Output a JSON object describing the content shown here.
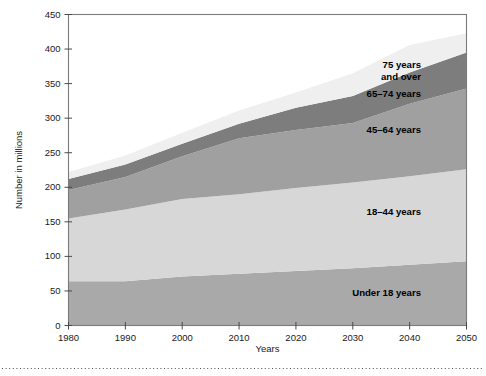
{
  "chart_data": {
    "type": "area",
    "stacked": true,
    "title": "",
    "xlabel": "Years",
    "ylabel": "Number in millions",
    "xlim": [
      1980,
      2050
    ],
    "ylim": [
      0,
      450
    ],
    "ytick_step": 50,
    "xtick_step": 10,
    "grid": false,
    "legend_position": "inline-right",
    "x": [
      1980,
      1990,
      2000,
      2010,
      2020,
      2030,
      2040,
      2050
    ],
    "xticklabels": [
      "1980",
      "1990",
      "2000",
      "2010",
      "2020",
      "2030",
      "2040",
      "2050"
    ],
    "yticklabels": [
      "0",
      "50",
      "100",
      "150",
      "200",
      "250",
      "300",
      "350",
      "400",
      "450"
    ],
    "series": [
      {
        "name": "Under 18 years",
        "label": "Under 18 years",
        "color": "#a9a9a9",
        "values": [
          64,
          64,
          71,
          75,
          79,
          83,
          88,
          93
        ]
      },
      {
        "name": "18-44 years",
        "label": "18–44 years",
        "color": "#d7d7d7",
        "values": [
          91,
          104,
          112,
          115,
          120,
          124,
          128,
          133
        ]
      },
      {
        "name": "45-64 years",
        "label": "45–64 years",
        "color": "#a0a0a0",
        "values": [
          41,
          47,
          62,
          81,
          84,
          86,
          105,
          117
        ]
      },
      {
        "name": "65-74 years",
        "label": "65–74 years",
        "color": "#7d7d7d",
        "values": [
          16,
          18,
          18,
          21,
          32,
          39,
          45,
          52
        ]
      },
      {
        "name": "75 years and over",
        "label": "75 years\nand over",
        "color": "#efefef",
        "values": [
          10,
          13,
          16,
          19,
          22,
          33,
          40,
          28
        ]
      }
    ],
    "cumulative_totals": [
      222,
      246,
      279,
      311,
      337,
      365,
      406,
      423
    ],
    "annotations": [
      {
        "name": "75 years and over",
        "lines": [
          "75 years",
          "and over"
        ],
        "x": 2042,
        "y": 372
      },
      {
        "name": "65-74 years",
        "lines": [
          "65–74 years"
        ],
        "x": 2042,
        "y": 330
      },
      {
        "name": "45-64 years",
        "lines": [
          "45–64 years"
        ],
        "x": 2042,
        "y": 278
      },
      {
        "name": "18-44 years",
        "lines": [
          "18–44 years"
        ],
        "x": 2042,
        "y": 160
      },
      {
        "name": "Under 18 years",
        "lines": [
          "Under 18 years"
        ],
        "x": 2042,
        "y": 42
      }
    ]
  },
  "figure": {
    "background_color": "#ffffff",
    "frame_color": "#7b7b7b",
    "footer_rule": "dotted"
  }
}
